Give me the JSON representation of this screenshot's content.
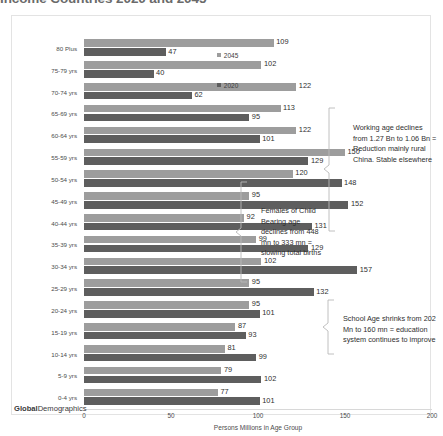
{
  "title": {
    "text": "Income Countries 2020 and 2045"
  },
  "brand": {
    "bold": "Global",
    "light": "Demographics"
  },
  "legend": {
    "position": "top-right-inside",
    "items": [
      {
        "label": "2045",
        "color": "#9d9d9d"
      },
      {
        "label": "2020",
        "color": "#5e5e5e"
      }
    ]
  },
  "annotations": [
    {
      "id": "working-age",
      "text": "Working age declines from 1.27 Bn to 1.06 Bn = Reduction mainly rural China. Stable elsewhere"
    },
    {
      "id": "females-child-bearing",
      "text": "Females of Child Bearing age declines from 448 mn to 333 mn = slowing total births"
    },
    {
      "id": "school-age",
      "text": "School Age shrinks from 202 Mn to 160 mn = education system continues to improve"
    }
  ],
  "chart_data": {
    "type": "bar",
    "orientation": "horizontal",
    "title": "Income Countries 2020 and 2045",
    "xlabel": "Persons Millions in Age Group",
    "ylabel": "",
    "xlim": [
      0,
      200
    ],
    "xticks": [
      0,
      50,
      100,
      150,
      200
    ],
    "grid": false,
    "legend_position": "top-right",
    "categories": [
      "80 Plus",
      "75-79 yrs",
      "70-74 yrs",
      "65-69 yrs",
      "60-64 yrs",
      "55-59 yrs",
      "50-54 yrs",
      "45-49 yrs",
      "40-44 yrs",
      "35-39 yrs",
      "30-34 yrs",
      "25-29 yrs",
      "20-24 yrs",
      "15-19 yrs",
      "10-14 yrs",
      "5-9 yrs",
      "0-4 yrs"
    ],
    "series": [
      {
        "name": "2045",
        "color": "#9d9d9d",
        "values": [
          109,
          102,
          122,
          113,
          122,
          150,
          120,
          95,
          92,
          99,
          102,
          95,
          95,
          87,
          81,
          79,
          77
        ]
      },
      {
        "name": "2020",
        "color": "#5e5e5e",
        "values": [
          47,
          40,
          62,
          95,
          101,
          129,
          148,
          152,
          131,
          129,
          157,
          132,
          101,
          93,
          99,
          102,
          101
        ]
      }
    ]
  }
}
